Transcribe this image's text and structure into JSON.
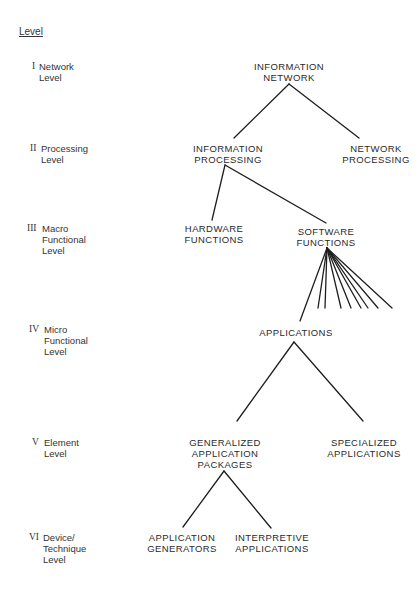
{
  "heading": "Level",
  "levels": [
    {
      "numeral": "I",
      "label": "Network\nLevel"
    },
    {
      "numeral": "II",
      "label": "Processing\nLevel"
    },
    {
      "numeral": "III",
      "label": "Macro\nFunctional\nLevel"
    },
    {
      "numeral": "IV",
      "label": "Micro\nFunctional\nLevel"
    },
    {
      "numeral": "V",
      "label": "Element\nLevel"
    },
    {
      "numeral": "VI",
      "label": "Device/\nTechnique\nLevel"
    }
  ],
  "nodes": {
    "information_network": "INFORMATION\nNETWORK",
    "information_processing": "INFORMATION\nPROCESSING",
    "network_processing": "NETWORK\nPROCESSING",
    "hardware_functions": "HARDWARE\nFUNCTIONS",
    "software_functions": "SOFTWARE\nFUNCTIONS",
    "applications": "APPLICATIONS",
    "generalized_application_packages": "GENERALIZED\nAPPLICATION\nPACKAGES",
    "specialized_applications": "SPECIALIZED\nAPPLICATIONS",
    "application_generators": "APPLICATION\nGENERATORS",
    "interpretive_applications": "INTERPRETIVE\nAPPLICATIONS"
  },
  "edges": [
    [
      "information_network",
      "information_processing"
    ],
    [
      "information_network",
      "network_processing"
    ],
    [
      "information_processing",
      "hardware_functions"
    ],
    [
      "information_processing",
      "software_functions"
    ],
    [
      "software_functions",
      "applications"
    ],
    [
      "applications",
      "generalized_application_packages"
    ],
    [
      "applications",
      "specialized_applications"
    ],
    [
      "generalized_application_packages",
      "application_generators"
    ],
    [
      "generalized_application_packages",
      "interpretive_applications"
    ]
  ],
  "software_functions_fan_count": 9,
  "line_color": "#1e1e1e"
}
